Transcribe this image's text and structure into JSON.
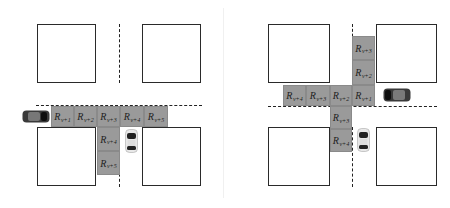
{
  "panels": [
    {
      "id": "left",
      "description": "Vehicle entering from left and turning right (down)",
      "cells": [
        {
          "symbol": "R",
          "sub": "v+1"
        },
        {
          "symbol": "R",
          "sub": "v+2"
        },
        {
          "symbol": "R",
          "sub": "v+3"
        },
        {
          "symbol": "R",
          "sub": "v+4"
        },
        {
          "symbol": "R",
          "sub": "v+5"
        },
        {
          "symbol": "R",
          "sub": "v+4"
        },
        {
          "symbol": "R",
          "sub": "v+5"
        }
      ]
    },
    {
      "id": "right",
      "description": "Vehicle entering from right with paths left and down",
      "cells": [
        {
          "symbol": "R",
          "sub": "v+3"
        },
        {
          "symbol": "R",
          "sub": "v+2"
        },
        {
          "symbol": "R",
          "sub": "v+4"
        },
        {
          "symbol": "R",
          "sub": "v+3"
        },
        {
          "symbol": "R",
          "sub": "v+2"
        },
        {
          "symbol": "R",
          "sub": "v+1"
        },
        {
          "symbol": "R",
          "sub": "v+3"
        },
        {
          "symbol": "R",
          "sub": "v+4"
        }
      ]
    }
  ],
  "colors": {
    "cell_fill": "#9a9a9a",
    "block_border": "#2a2a2a",
    "car_dark": "#2b2b2b",
    "car_light": "#e6e6e6"
  }
}
